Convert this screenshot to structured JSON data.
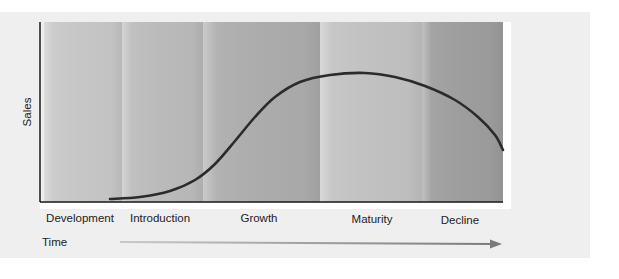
{
  "diagram": {
    "y_axis_label": "Sales",
    "x_axis_label": "Time",
    "stages": [
      {
        "name": "Development",
        "x0": 44,
        "x1": 122,
        "fill": "#c9c9c9"
      },
      {
        "name": "Introduction",
        "x0": 122,
        "x1": 203,
        "fill": "#bdbdbd"
      },
      {
        "name": "Growth",
        "x0": 203,
        "x1": 320,
        "fill": "#aeaeae"
      },
      {
        "name": "Maturity",
        "x0": 320,
        "x1": 422,
        "fill": "#c4c4c4"
      },
      {
        "name": "Decline",
        "x0": 422,
        "x1": 503,
        "fill": "#9f9f9f"
      }
    ],
    "curve_points": [
      [
        110,
        199
      ],
      [
        140,
        197
      ],
      [
        170,
        191
      ],
      [
        195,
        180
      ],
      [
        215,
        164
      ],
      [
        235,
        141
      ],
      [
        255,
        117
      ],
      [
        275,
        97
      ],
      [
        300,
        82
      ],
      [
        330,
        75
      ],
      [
        365,
        73
      ],
      [
        395,
        77
      ],
      [
        425,
        86
      ],
      [
        455,
        100
      ],
      [
        478,
        117
      ],
      [
        495,
        135
      ],
      [
        503,
        150
      ]
    ],
    "colors": {
      "panel": "#efefef",
      "axis": "#1a1a1a",
      "curve": "#2b2b2b",
      "arrow": "#8a8a8a"
    }
  }
}
